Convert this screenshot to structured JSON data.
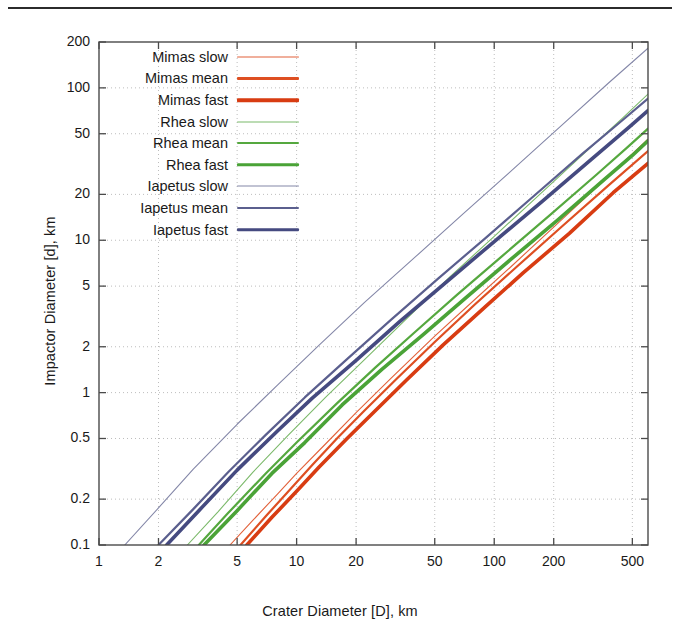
{
  "figure": {
    "xaxis_title": "Crater Diameter [D], km",
    "yaxis_title": "Impactor Diameter [d], km"
  },
  "legend": {
    "items": [
      {
        "label": "Mimas slow",
        "color": "#e2613a",
        "width": 1.1
      },
      {
        "label": "Mimas mean",
        "color": "#de4f22",
        "width": 2.2
      },
      {
        "label": "Mimas fast",
        "color": "#d83c12",
        "width": 3.6
      },
      {
        "label": "Rhea slow",
        "color": "#7bb96a",
        "width": 1.1
      },
      {
        "label": "Rhea mean",
        "color": "#55a83f",
        "width": 2.2
      },
      {
        "label": "Rhea fast",
        "color": "#4aa337",
        "width": 3.6
      },
      {
        "label": "Iapetus slow",
        "color": "#8487a8",
        "width": 1.1
      },
      {
        "label": "Iapetus mean",
        "color": "#5b5f8e",
        "width": 2.2
      },
      {
        "label": "Iapetus fast",
        "color": "#454a80",
        "width": 3.6
      }
    ]
  },
  "chart_data": {
    "type": "line",
    "title": "",
    "xlabel": "Crater Diameter [D], km",
    "ylabel": "Impactor Diameter [d], km",
    "xscale": "log",
    "yscale": "log",
    "xlim": [
      1,
      600
    ],
    "ylim": [
      0.1,
      200
    ],
    "xticks": [
      1,
      2,
      5,
      10,
      20,
      50,
      100,
      200,
      500
    ],
    "xtick_labels": [
      "1",
      "2",
      "5",
      "10",
      "20",
      "50",
      "100",
      "200",
      "500"
    ],
    "yticks": [
      0.1,
      0.2,
      0.5,
      1,
      2,
      5,
      10,
      20,
      50,
      100,
      200
    ],
    "ytick_labels": [
      "0.1",
      "0.2",
      "0.5",
      "1",
      "2",
      "5",
      "10",
      "20",
      "50",
      "100",
      "200"
    ],
    "grid": true,
    "legend_position": "upper left",
    "series": [
      {
        "name": "Mimas slow",
        "color": "#e2613a",
        "linewidth": 1.1,
        "x": [
          4.6,
          6,
          8,
          10,
          14,
          20,
          30,
          50,
          80,
          120,
          200,
          350,
          600
        ],
        "y": [
          0.1,
          0.145,
          0.216,
          0.295,
          0.46,
          0.74,
          1.24,
          2.35,
          4.1,
          6.6,
          12.2,
          24.0,
          46.0
        ]
      },
      {
        "name": "Mimas mean",
        "color": "#de4f22",
        "linewidth": 2.2,
        "x": [
          5.2,
          7,
          9,
          12,
          16,
          22,
          32,
          50,
          80,
          130,
          220,
          380,
          600
        ],
        "y": [
          0.1,
          0.155,
          0.222,
          0.335,
          0.5,
          0.76,
          1.23,
          2.15,
          3.8,
          6.7,
          12.3,
          23.0,
          38.5
        ]
      },
      {
        "name": "Mimas fast",
        "color": "#d83c12",
        "linewidth": 3.6,
        "x": [
          5.6,
          7.5,
          10,
          13,
          18,
          25,
          36,
          55,
          90,
          140,
          240,
          400,
          600
        ],
        "y": [
          0.1,
          0.152,
          0.225,
          0.325,
          0.5,
          0.76,
          1.21,
          2.05,
          3.65,
          6.1,
          11.1,
          20.5,
          32.0
        ]
      },
      {
        "name": "Rhea slow",
        "color": "#7bb96a",
        "linewidth": 1.1,
        "x": [
          2.8,
          4,
          6,
          9,
          14,
          22,
          35,
          60,
          100,
          170,
          300,
          450,
          600
        ],
        "y": [
          0.1,
          0.165,
          0.3,
          0.52,
          0.93,
          1.64,
          2.95,
          5.8,
          10.6,
          20.0,
          39.5,
          64.0,
          91.0
        ]
      },
      {
        "name": "Rhea mean",
        "color": "#55a83f",
        "linewidth": 2.2,
        "x": [
          3.2,
          4.5,
          7,
          10,
          16,
          25,
          40,
          65,
          110,
          190,
          330,
          470,
          600
        ],
        "y": [
          0.1,
          0.162,
          0.296,
          0.47,
          0.85,
          1.46,
          2.52,
          4.4,
          7.9,
          14.5,
          27.0,
          40.5,
          54.0
        ]
      },
      {
        "name": "Rhea fast",
        "color": "#4aa337",
        "linewidth": 3.6,
        "x": [
          3.4,
          5,
          7.5,
          11,
          17,
          27,
          44,
          72,
          120,
          210,
          360,
          500,
          600
        ],
        "y": [
          0.1,
          0.168,
          0.295,
          0.47,
          0.83,
          1.42,
          2.42,
          4.2,
          7.4,
          13.6,
          25.0,
          36.0,
          45.0
        ]
      },
      {
        "name": "Iapetus slow",
        "color": "#8487a8",
        "linewidth": 1.1,
        "x": [
          1.35,
          2,
          3,
          5,
          8,
          13,
          22,
          40,
          70,
          120,
          220,
          380,
          600
        ],
        "y": [
          0.1,
          0.175,
          0.315,
          0.62,
          1.12,
          2.05,
          3.9,
          7.8,
          15.0,
          28.0,
          57.0,
          108.0,
          182.0
        ]
      },
      {
        "name": "Iapetus mean",
        "color": "#5b5f8e",
        "linewidth": 2.2,
        "x": [
          2.0,
          3,
          4.5,
          7,
          11,
          18,
          30,
          52,
          90,
          155,
          280,
          450,
          600
        ],
        "y": [
          0.1,
          0.172,
          0.3,
          0.53,
          0.93,
          1.66,
          3.0,
          5.6,
          10.3,
          19.0,
          37.0,
          62.0,
          85.0
        ]
      },
      {
        "name": "Iapetus fast",
        "color": "#454a80",
        "linewidth": 3.6,
        "x": [
          2.2,
          3.2,
          5,
          8,
          12,
          20,
          33,
          58,
          100,
          175,
          310,
          480,
          600
        ],
        "y": [
          0.1,
          0.168,
          0.31,
          0.56,
          0.92,
          1.63,
          2.9,
          5.4,
          9.8,
          18.0,
          34.0,
          55.0,
          71.0
        ]
      }
    ]
  }
}
